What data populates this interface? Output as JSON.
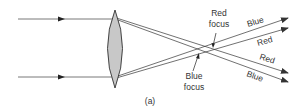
{
  "diagram": {
    "caption": "(a)",
    "lens": {
      "type": "converging-lens",
      "fill": "#c8c8c8",
      "stroke": "#333333"
    },
    "labels": {
      "red_focus_line1": "Red",
      "red_focus_line2": "focus",
      "blue_focus_line1": "Blue",
      "blue_focus_line2": "focus",
      "out_top_blue": "Blue",
      "out_top_red": "Red",
      "out_bottom_red": "Red",
      "out_bottom_blue": "Blue"
    },
    "colors": {
      "ray": "#333333",
      "text": "#333333"
    }
  }
}
